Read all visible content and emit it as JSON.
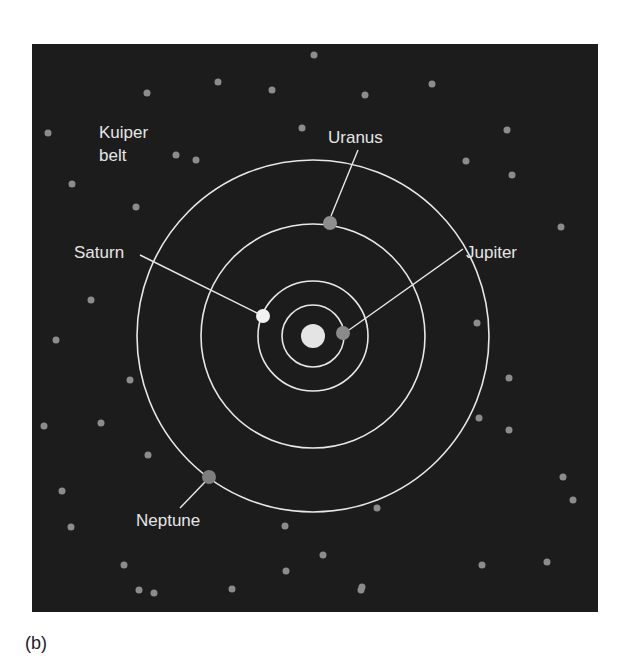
{
  "figure": {
    "caption": "(b)",
    "background_color": "#1c1c1c",
    "orbit_color": "#e8e8e8",
    "sun": {
      "name": "Sun",
      "cx": 313,
      "cy": 336,
      "r": 12,
      "color": "#e4e4e4"
    },
    "orbits": [
      {
        "name": "Jupiter orbit",
        "r": 31
      },
      {
        "name": "Saturn orbit",
        "r": 55
      },
      {
        "name": "Uranus orbit",
        "r": 112
      },
      {
        "name": "Neptune orbit",
        "r": 176
      }
    ],
    "planets": [
      {
        "name": "Jupiter",
        "cx": 343,
        "cy": 333,
        "r": 7,
        "color": "#8a8a8a"
      },
      {
        "name": "Saturn",
        "cx": 263,
        "cy": 316,
        "r": 7,
        "color": "#f2f2f2"
      },
      {
        "name": "Uranus",
        "cx": 330,
        "cy": 223,
        "r": 7,
        "color": "#8e8e8e"
      },
      {
        "name": "Neptune",
        "cx": 209,
        "cy": 477,
        "r": 7,
        "color": "#7e7e7e"
      }
    ],
    "leader_lines": [
      {
        "to": "Jupiter",
        "x1": 349,
        "y1": 330,
        "x2": 463,
        "y2": 249
      },
      {
        "to": "Saturn",
        "x1": 257,
        "y1": 313,
        "x2": 140,
        "y2": 255
      },
      {
        "to": "Uranus",
        "x1": 331,
        "y1": 216,
        "x2": 358,
        "y2": 150
      },
      {
        "to": "Neptune",
        "x1": 205,
        "y1": 482,
        "x2": 180,
        "y2": 508
      }
    ],
    "labels": {
      "kuiper_line1": "Kuiper",
      "kuiper_line2": "belt",
      "saturn": "Saturn",
      "uranus": "Uranus",
      "jupiter": "Jupiter",
      "neptune": "Neptune"
    },
    "kuiper_belt_objects": {
      "color": "#8c8c8c",
      "r": 3.5,
      "points": [
        [
          48,
          133
        ],
        [
          72,
          184
        ],
        [
          91,
          300
        ],
        [
          56,
          340
        ],
        [
          136,
          207
        ],
        [
          176,
          155
        ],
        [
          196,
          160
        ],
        [
          147,
          93
        ],
        [
          218,
          82
        ],
        [
          272,
          90
        ],
        [
          314,
          55
        ],
        [
          302,
          128
        ],
        [
          365,
          95
        ],
        [
          432,
          84
        ],
        [
          466,
          161
        ],
        [
          507,
          130
        ],
        [
          512,
          175
        ],
        [
          561,
          227
        ],
        [
          477,
          323
        ],
        [
          509,
          378
        ],
        [
          509,
          430
        ],
        [
          479,
          418
        ],
        [
          563,
          477
        ],
        [
          573,
          500
        ],
        [
          482,
          565
        ],
        [
          547,
          562
        ],
        [
          101,
          423
        ],
        [
          130,
          380
        ],
        [
          148,
          455
        ],
        [
          44,
          426
        ],
        [
          62,
          491
        ],
        [
          71,
          527
        ],
        [
          124,
          565
        ],
        [
          139,
          590
        ],
        [
          232,
          589
        ],
        [
          286,
          571
        ],
        [
          285,
          526
        ],
        [
          323,
          555
        ],
        [
          362,
          587
        ],
        [
          377,
          508
        ],
        [
          361,
          590
        ],
        [
          154,
          593
        ]
      ]
    }
  }
}
